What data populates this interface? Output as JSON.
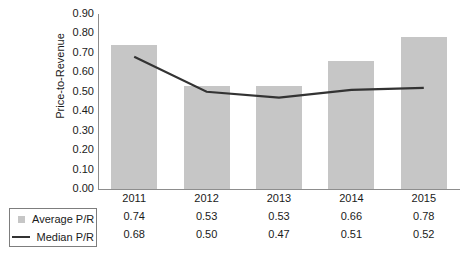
{
  "chart_data": {
    "type": "bar",
    "title": "",
    "xlabel": "",
    "ylabel": "Price-to-Revenue",
    "ylim": [
      0.0,
      0.9
    ],
    "grid": false,
    "legend_position": "bottom-left",
    "categories": [
      "2011",
      "2012",
      "2013",
      "2014",
      "2015"
    ],
    "ytick_labels": [
      "0.90",
      "0.80",
      "0.70",
      "0.60",
      "0.50",
      "0.40",
      "0.30",
      "0.20",
      "0.10",
      "0.00"
    ],
    "ytick_values": [
      0.9,
      0.8,
      0.7,
      0.6,
      0.5,
      0.4,
      0.3,
      0.2,
      0.1,
      0.0
    ],
    "series": [
      {
        "name": "Average P/R",
        "type": "bar",
        "color": "#c6c6c6",
        "values": [
          0.74,
          0.53,
          0.53,
          0.66,
          0.78
        ],
        "labels": [
          "0.74",
          "0.53",
          "0.53",
          "0.66",
          "0.78"
        ]
      },
      {
        "name": "Median P/R",
        "type": "line",
        "color": "#333333",
        "values": [
          0.68,
          0.5,
          0.47,
          0.51,
          0.52
        ],
        "labels": [
          "0.68",
          "0.50",
          "0.47",
          "0.51",
          "0.52"
        ]
      }
    ]
  },
  "legend": {
    "entries": [
      {
        "label": "Average P/R",
        "marker": "square-swatch"
      },
      {
        "label": "Median P/R",
        "marker": "line-dash"
      }
    ]
  }
}
